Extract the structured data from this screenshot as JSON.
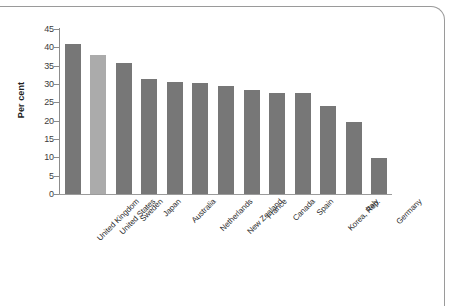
{
  "chart_data": {
    "type": "bar",
    "title": "",
    "subtitle": "",
    "xlabel": "",
    "ylabel": "Per cent",
    "ylim": [
      0,
      45
    ],
    "ytick_step": 5,
    "yticks": [
      "45",
      "40",
      "35",
      "30",
      "25",
      "20",
      "15",
      "10",
      "5",
      "0"
    ],
    "grid": false,
    "legend": null,
    "categories": [
      "United Kingdom",
      "United States",
      "Sweden",
      "Japan",
      "Australia",
      "Netherlands",
      "New Zealand",
      "France",
      "Canada",
      "Spain",
      "Korea, Rep.",
      "Italy",
      "Germany"
    ],
    "values": [
      40.8,
      37.8,
      35.7,
      31.3,
      30.6,
      30.4,
      29.5,
      28.3,
      27.6,
      27.5,
      24.0,
      19.7,
      9.8
    ],
    "highlighted_category": "United States",
    "colors": {
      "bar": "#777777",
      "bar_highlight": "#ababab",
      "axis": "#8c8c8c",
      "text": "#2b2b2b",
      "frame": "#9a9a9a",
      "background": "#ffffff"
    }
  }
}
